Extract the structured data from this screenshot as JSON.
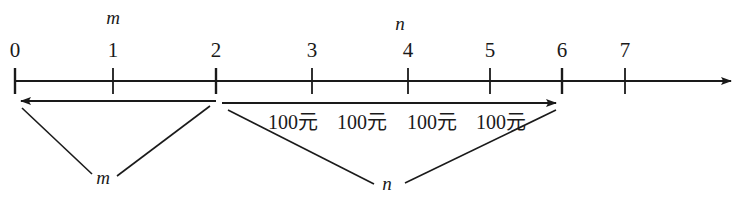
{
  "figure": {
    "type": "number-line-timeline-diagram",
    "axis": {
      "arrow_direction": "right",
      "tick_labels": [
        "0",
        "1",
        "2",
        "3",
        "4",
        "5",
        "6",
        "7"
      ],
      "tick_x": [
        15,
        113,
        216,
        312,
        408,
        490,
        562,
        625
      ],
      "axis_y": 81,
      "axis_start_x": 15,
      "axis_end_x": 737,
      "color": "#1a1a1a"
    },
    "top_labels": [
      {
        "text": "m",
        "x": 113,
        "y": 8
      },
      {
        "text": "n",
        "x": 400,
        "y": 14
      }
    ],
    "brackets": [
      {
        "name": "m-bracket",
        "from_x": 216,
        "to_x": 15,
        "y": 101,
        "arrow_at": "left",
        "label": "m"
      },
      {
        "name": "n-bracket",
        "from_x": 222,
        "to_x": 562,
        "y": 103,
        "arrow_at": "right",
        "label": "n"
      }
    ],
    "money_labels": [
      {
        "text": "100元",
        "x": 293
      },
      {
        "text": "100元",
        "x": 362
      },
      {
        "text": "100元",
        "x": 432
      },
      {
        "text": "100元",
        "x": 501
      }
    ],
    "money_label_y": 112,
    "callouts": [
      {
        "name": "m-callout",
        "label": "m",
        "label_x": 103,
        "label_y": 168,
        "leader_lines": [
          {
            "x1": 22,
            "y1": 108,
            "x2": 92,
            "y2": 174
          },
          {
            "x1": 210,
            "y1": 106,
            "x2": 117,
            "y2": 176
          }
        ]
      },
      {
        "name": "n-callout",
        "label": "n",
        "label_x": 387,
        "label_y": 174,
        "leader_lines": [
          {
            "x1": 228,
            "y1": 110,
            "x2": 374,
            "y2": 184
          },
          {
            "x1": 556,
            "y1": 110,
            "x2": 405,
            "y2": 183
          }
        ]
      }
    ]
  }
}
